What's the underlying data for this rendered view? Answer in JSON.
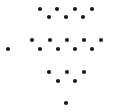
{
  "diagram": {
    "background": "#ffffff",
    "dot_color": "#1a1a1a",
    "dot_radius": 2.1,
    "width": 115,
    "height": 112,
    "groups": [
      {
        "name": "top-group",
        "dots": [
          {
            "x": 40,
            "y": 9
          },
          {
            "x": 57,
            "y": 9
          },
          {
            "x": 75,
            "y": 9
          },
          {
            "x": 92,
            "y": 9
          },
          {
            "x": 49,
            "y": 17
          },
          {
            "x": 66,
            "y": 17
          },
          {
            "x": 83,
            "y": 17
          }
        ]
      },
      {
        "name": "middle-group",
        "dots": [
          {
            "x": 32,
            "y": 40
          },
          {
            "x": 50,
            "y": 40
          },
          {
            "x": 67,
            "y": 40
          },
          {
            "x": 84,
            "y": 40
          },
          {
            "x": 101,
            "y": 40
          },
          {
            "x": 40,
            "y": 49
          },
          {
            "x": 58,
            "y": 49
          },
          {
            "x": 75,
            "y": 49
          },
          {
            "x": 92,
            "y": 49
          }
        ]
      },
      {
        "name": "isolated-left",
        "dots": [
          {
            "x": 8,
            "y": 49
          }
        ]
      },
      {
        "name": "bottom-group",
        "dots": [
          {
            "x": 49,
            "y": 72
          },
          {
            "x": 67,
            "y": 72
          },
          {
            "x": 84,
            "y": 72
          },
          {
            "x": 58,
            "y": 81
          },
          {
            "x": 75,
            "y": 81
          }
        ]
      },
      {
        "name": "isolated-bottom",
        "dots": [
          {
            "x": 66,
            "y": 103
          }
        ]
      }
    ]
  }
}
